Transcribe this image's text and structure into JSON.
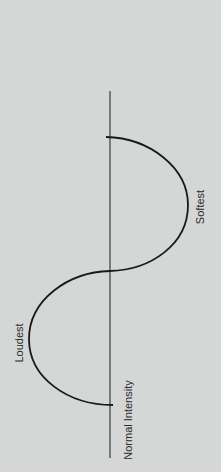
{
  "diagram": {
    "title": "",
    "orientation": "rotated-90-ccw",
    "labels": {
      "baseline": "Normal Intensity",
      "peak": "Loudest",
      "trough": "Softest"
    },
    "colors": {
      "background": "#d5d7d7",
      "line": "#1a1a1a",
      "text": "#2a2a2a"
    }
  }
}
